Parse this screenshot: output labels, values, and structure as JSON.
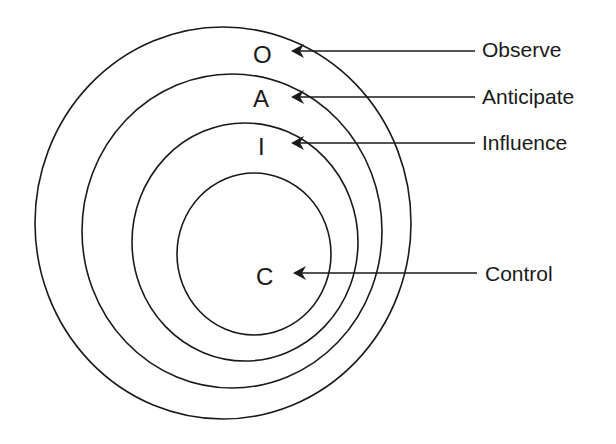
{
  "diagram": {
    "type": "nested-ellipses",
    "rings": [
      {
        "id": "observe",
        "letter": "O",
        "label": "Observe"
      },
      {
        "id": "anticipate",
        "letter": "A",
        "label": "Anticipate"
      },
      {
        "id": "influence",
        "letter": "I",
        "label": "Influence"
      },
      {
        "id": "control",
        "letter": "C",
        "label": "Control"
      }
    ],
    "colors": {
      "stroke": "#1a1a1a",
      "background": "#ffffff"
    }
  }
}
